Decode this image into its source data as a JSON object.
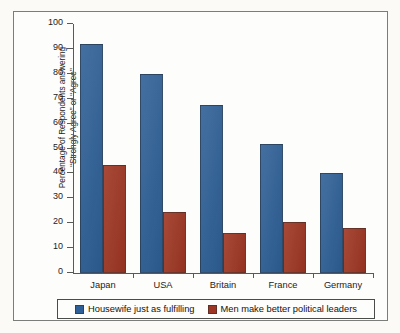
{
  "chart_data": {
    "type": "bar",
    "title": "",
    "subtitle": "",
    "xlabel": "",
    "ylabel_lines": [
      "Percentage of Respondents answering",
      "“Strongly Agree” or “Agree”"
    ],
    "ylabel": "Percentage of Respondents answering “Strongly Agree” or “Agree”",
    "categories": [
      "Japan",
      "USA",
      "Britain",
      "France",
      "Germany"
    ],
    "series": [
      {
        "name": "Housewife just as fulfilling",
        "color": "#2e5f96",
        "values": [
          92,
          80,
          67.5,
          52,
          40
        ]
      },
      {
        "name": "Men make better political leaders",
        "color": "#9e3522",
        "values": [
          43.5,
          24.5,
          16,
          20.5,
          18
        ]
      }
    ],
    "ylim": [
      0,
      100
    ],
    "ytick_labels": [
      "0",
      "10",
      "20",
      "30",
      "40",
      "50",
      "60",
      "70",
      "80",
      "90",
      "100"
    ],
    "ytick_values": [
      0,
      10,
      20,
      30,
      40,
      50,
      60,
      70,
      80,
      90,
      100
    ],
    "grid": false,
    "legend_position": "bottom",
    "bar_orientation": "vertical",
    "group_mode": "grouped"
  },
  "legend": {
    "entries": [
      {
        "label": "Housewife just as fulfilling",
        "color": "#2e5f96",
        "swatch_name": "blue-swatch"
      },
      {
        "label": "Men make better political leaders",
        "color": "#9e3522",
        "swatch_name": "red-swatch"
      }
    ]
  },
  "colors": {
    "series_blue": "#2e5f96",
    "series_red": "#9e3522",
    "axis": "#585a57",
    "frame": "#7b7d7a",
    "page_background": "#fbfaf6",
    "plot_background": "#fdfdfb",
    "text": "#1c1c1c"
  }
}
